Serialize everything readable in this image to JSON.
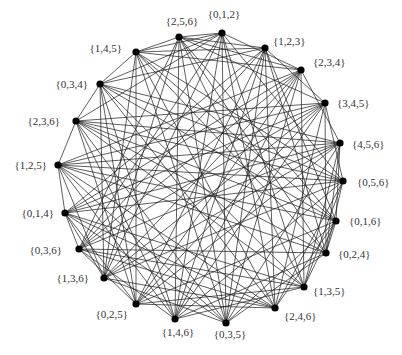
{
  "diagram": {
    "type": "graph",
    "node_color": "#000000",
    "edge_color": "#1a1a1a",
    "nodes": [
      {
        "label": "{0,1,2}",
        "x": 222,
        "y": 33,
        "lx": 224,
        "ly": 18,
        "anchor": "middle"
      },
      {
        "label": "{1,2,3}",
        "x": 265,
        "y": 48,
        "lx": 273,
        "ly": 45,
        "anchor": "start"
      },
      {
        "label": "{2,3,4}",
        "x": 301,
        "y": 70,
        "lx": 313,
        "ly": 66,
        "anchor": "start"
      },
      {
        "label": "{3,4,5}",
        "x": 325,
        "y": 103,
        "lx": 337,
        "ly": 107,
        "anchor": "start"
      },
      {
        "label": "{4,5,6}",
        "x": 340,
        "y": 143,
        "lx": 352,
        "ly": 148,
        "anchor": "start"
      },
      {
        "label": "{0,5,6}",
        "x": 343,
        "y": 181,
        "lx": 357,
        "ly": 186,
        "anchor": "start"
      },
      {
        "label": "{0,1,6}",
        "x": 336,
        "y": 221,
        "lx": 349,
        "ly": 225,
        "anchor": "start"
      },
      {
        "label": "{0,2,4}",
        "x": 326,
        "y": 253,
        "lx": 338,
        "ly": 258,
        "anchor": "start"
      },
      {
        "label": "{1,3,5}",
        "x": 304,
        "y": 287,
        "lx": 313,
        "ly": 295,
        "anchor": "start"
      },
      {
        "label": "{2,4,6}",
        "x": 275,
        "y": 308,
        "lx": 284,
        "ly": 320,
        "anchor": "start"
      },
      {
        "label": "{0,3,5}",
        "x": 226,
        "y": 323,
        "lx": 230,
        "ly": 338,
        "anchor": "middle"
      },
      {
        "label": "{1,4,6}",
        "x": 175,
        "y": 319,
        "lx": 178,
        "ly": 336,
        "anchor": "middle"
      },
      {
        "label": "{0,2,5}",
        "x": 136,
        "y": 304,
        "lx": 128,
        "ly": 318,
        "anchor": "end"
      },
      {
        "label": "{1,3,6}",
        "x": 104,
        "y": 278,
        "lx": 89,
        "ly": 282,
        "anchor": "end"
      },
      {
        "label": "{0,3,6}",
        "x": 79,
        "y": 249,
        "lx": 62,
        "ly": 254,
        "anchor": "end"
      },
      {
        "label": "{0,1,4}",
        "x": 65,
        "y": 213,
        "lx": 54,
        "ly": 217,
        "anchor": "end"
      },
      {
        "label": "{1,2,5}",
        "x": 58,
        "y": 165,
        "lx": 47,
        "ly": 169,
        "anchor": "end"
      },
      {
        "label": "{2,3,6}",
        "x": 76,
        "y": 121,
        "lx": 60,
        "ly": 125,
        "anchor": "end"
      },
      {
        "label": "{0,3,4}",
        "x": 100,
        "y": 84,
        "lx": 88,
        "ly": 88,
        "anchor": "end"
      },
      {
        "label": "{1,4,5}",
        "x": 136,
        "y": 52,
        "lx": 122,
        "ly": 52,
        "anchor": "end"
      },
      {
        "label": "{2,5,6}",
        "x": 179,
        "y": 37,
        "lx": 182,
        "ly": 25,
        "anchor": "middle"
      }
    ],
    "edges": [
      [
        0,
        2
      ],
      [
        0,
        5
      ],
      [
        0,
        8
      ],
      [
        0,
        9
      ],
      [
        0,
        10
      ],
      [
        0,
        11
      ],
      [
        0,
        13
      ],
      [
        0,
        14
      ],
      [
        0,
        17
      ],
      [
        0,
        18
      ],
      [
        0,
        19
      ],
      [
        0,
        20
      ],
      [
        1,
        3
      ],
      [
        1,
        6
      ],
      [
        1,
        7
      ],
      [
        1,
        9
      ],
      [
        1,
        10
      ],
      [
        1,
        11
      ],
      [
        1,
        12
      ],
      [
        1,
        14
      ],
      [
        1,
        15
      ],
      [
        1,
        18
      ],
      [
        1,
        19
      ],
      [
        1,
        20
      ],
      [
        2,
        4
      ],
      [
        2,
        8
      ],
      [
        2,
        10
      ],
      [
        2,
        11
      ],
      [
        2,
        12
      ],
      [
        2,
        13
      ],
      [
        2,
        14
      ],
      [
        2,
        15
      ],
      [
        2,
        16
      ],
      [
        2,
        19
      ],
      [
        2,
        20
      ],
      [
        3,
        5
      ],
      [
        3,
        7
      ],
      [
        3,
        9
      ],
      [
        3,
        11
      ],
      [
        3,
        12
      ],
      [
        3,
        13
      ],
      [
        3,
        14
      ],
      [
        3,
        15
      ],
      [
        3,
        16
      ],
      [
        3,
        17
      ],
      [
        3,
        20
      ],
      [
        4,
        6
      ],
      [
        4,
        7
      ],
      [
        4,
        8
      ],
      [
        4,
        10
      ],
      [
        4,
        12
      ],
      [
        4,
        13
      ],
      [
        4,
        14
      ],
      [
        4,
        15
      ],
      [
        4,
        16
      ],
      [
        4,
        17
      ],
      [
        4,
        18
      ],
      [
        5,
        7
      ],
      [
        5,
        8
      ],
      [
        5,
        9
      ],
      [
        5,
        11
      ],
      [
        5,
        13
      ],
      [
        5,
        15
      ],
      [
        5,
        16
      ],
      [
        5,
        17
      ],
      [
        5,
        18
      ],
      [
        5,
        19
      ],
      [
        6,
        7
      ],
      [
        6,
        8
      ],
      [
        6,
        9
      ],
      [
        6,
        10
      ],
      [
        6,
        12
      ],
      [
        6,
        16
      ],
      [
        6,
        17
      ],
      [
        6,
        18
      ],
      [
        6,
        19
      ],
      [
        6,
        20
      ],
      [
        7,
        10
      ],
      [
        7,
        11
      ],
      [
        7,
        14
      ],
      [
        7,
        16
      ],
      [
        7,
        17
      ],
      [
        7,
        19
      ],
      [
        7,
        20
      ],
      [
        8,
        11
      ],
      [
        8,
        12
      ],
      [
        8,
        14
      ],
      [
        8,
        15
      ],
      [
        8,
        17
      ],
      [
        8,
        18
      ],
      [
        8,
        20
      ],
      [
        9,
        12
      ],
      [
        9,
        13
      ],
      [
        9,
        14
      ],
      [
        9,
        15
      ],
      [
        9,
        16
      ],
      [
        9,
        18
      ],
      [
        9,
        19
      ],
      [
        10,
        13
      ],
      [
        10,
        15
      ],
      [
        10,
        16
      ],
      [
        10,
        17
      ],
      [
        10,
        19
      ],
      [
        10,
        20
      ],
      [
        11,
        14
      ],
      [
        11,
        16
      ],
      [
        11,
        17
      ],
      [
        11,
        18
      ],
      [
        11,
        20
      ],
      [
        12,
        14
      ],
      [
        12,
        15
      ],
      [
        12,
        17
      ],
      [
        12,
        18
      ],
      [
        12,
        19
      ],
      [
        13,
        15
      ],
      [
        13,
        16
      ],
      [
        13,
        18
      ],
      [
        13,
        19
      ],
      [
        13,
        20
      ],
      [
        14,
        15
      ],
      [
        14,
        20
      ],
      [
        15,
        16
      ],
      [
        16,
        17
      ],
      [
        17,
        18
      ],
      [
        18,
        19
      ],
      [
        19,
        20
      ]
    ]
  }
}
